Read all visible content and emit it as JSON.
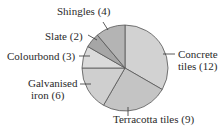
{
  "chart_data": {
    "type": "pie",
    "title": "",
    "categories": [
      "Concrete tiles",
      "Terracotta tiles",
      "Galvanised iron",
      "Colourbond",
      "Slate",
      "Shingles"
    ],
    "values": [
      12,
      9,
      6,
      3,
      2,
      4
    ],
    "colors": [
      "#d2d2d2",
      "#c4c4c4",
      "#cfcfcf",
      "#dadada",
      "#a6a6a6",
      "#b4b4b4"
    ],
    "start_angle_deg": 0,
    "direction": "clockwise",
    "labels": [
      {
        "line1": "Concrete",
        "line2": "tiles (12)"
      },
      {
        "line1": "Terracotta tiles (9)",
        "line2": ""
      },
      {
        "line1": "Galvanised",
        "line2": "iron (6)"
      },
      {
        "line1": "Colourbond (3)",
        "line2": ""
      },
      {
        "line1": "Slate (2)",
        "line2": ""
      },
      {
        "line1": "Shingles (4)",
        "line2": ""
      }
    ],
    "legend": "none"
  }
}
